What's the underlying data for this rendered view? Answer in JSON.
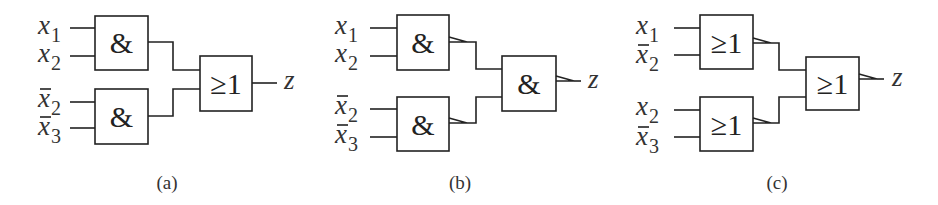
{
  "diagrams": [
    {
      "id": "a",
      "caption": "(a)",
      "inputs": [
        {
          "var": "x",
          "sub": "1",
          "negated": false
        },
        {
          "var": "x",
          "sub": "2",
          "negated": false
        },
        {
          "var": "x",
          "sub": "2",
          "negated": true
        },
        {
          "var": "x",
          "sub": "3",
          "negated": true
        }
      ],
      "gates": {
        "top": "&",
        "bottom": "&",
        "final": "≥1"
      },
      "inverted_outputs": false,
      "output": "z"
    },
    {
      "id": "b",
      "caption": "(b)",
      "inputs": [
        {
          "var": "x",
          "sub": "1",
          "negated": false
        },
        {
          "var": "x",
          "sub": "2",
          "negated": false
        },
        {
          "var": "x",
          "sub": "2",
          "negated": true
        },
        {
          "var": "x",
          "sub": "3",
          "negated": true
        }
      ],
      "gates": {
        "top": "&",
        "bottom": "&",
        "final": "&"
      },
      "inverted_outputs": true,
      "output": "z"
    },
    {
      "id": "c",
      "caption": "(c)",
      "inputs": [
        {
          "var": "x",
          "sub": "1",
          "negated": false
        },
        {
          "var": "x",
          "sub": "2",
          "negated": true
        },
        {
          "var": "x",
          "sub": "2",
          "negated": false
        },
        {
          "var": "x",
          "sub": "3",
          "negated": true
        }
      ],
      "gates": {
        "top": "≥1",
        "bottom": "≥1",
        "final": "≥1"
      },
      "inverted_outputs": true,
      "output": "z"
    }
  ],
  "colors": {
    "line": "#222222",
    "text": "#333333",
    "background": "#ffffff"
  }
}
